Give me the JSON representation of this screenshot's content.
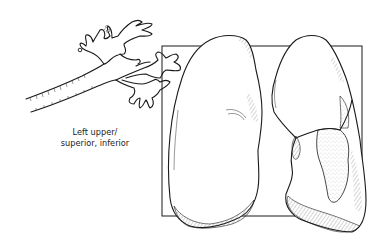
{
  "figure": {
    "caption": {
      "line1": "Left upper/",
      "line2": "superior, inferior"
    },
    "elements": {
      "bronchial_tree": "bronchial-tree-drawing",
      "frame": "square-backdrop-frame",
      "right_lung": "lung-left-in-image",
      "left_lung": "lung-right-in-image-with-stippled-region"
    },
    "colors": {
      "ink": "#1a1a1a",
      "background": "#ffffff"
    }
  }
}
